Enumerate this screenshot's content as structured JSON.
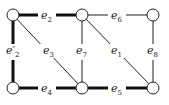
{
  "diagram": {
    "type": "graph",
    "nodes": [
      {
        "id": "tl",
        "x": 13,
        "y": 15
      },
      {
        "id": "tm",
        "x": 82,
        "y": 15
      },
      {
        "id": "tr",
        "x": 153,
        "y": 15
      },
      {
        "id": "bl",
        "x": 13,
        "y": 88
      },
      {
        "id": "bm",
        "x": 82,
        "y": 88
      },
      {
        "id": "br",
        "x": 153,
        "y": 88
      }
    ],
    "edges": [
      {
        "label": "e",
        "sub": "2",
        "prime": false,
        "from": "tl",
        "to": "tm",
        "thick": true
      },
      {
        "label": "e",
        "sub": "6",
        "prime": false,
        "from": "tm",
        "to": "tr",
        "thick": false
      },
      {
        "label": "e",
        "sub": "2",
        "prime": true,
        "from": "tl",
        "to": "bl",
        "thick": true
      },
      {
        "label": "e",
        "sub": "3",
        "prime": false,
        "from": "tl",
        "to": "bm",
        "thick": false
      },
      {
        "label": "e",
        "sub": "7",
        "prime": false,
        "from": "tm",
        "to": "bm",
        "thick": false
      },
      {
        "label": "e",
        "sub": "1",
        "prime": false,
        "from": "tm",
        "to": "br",
        "thick": false
      },
      {
        "label": "e",
        "sub": "8",
        "prime": false,
        "from": "tr",
        "to": "br",
        "thick": false
      },
      {
        "label": "e",
        "sub": "4",
        "prime": false,
        "from": "bl",
        "to": "bm",
        "thick": true
      },
      {
        "label": "e",
        "sub": "5",
        "prime": false,
        "from": "bm",
        "to": "br",
        "thick": true
      }
    ],
    "labels": {
      "e2": "e",
      "e2_sub": "2",
      "e2p": "e′",
      "e2p_sub": "2",
      "e3": "e",
      "e3_sub": "3",
      "e7": "e",
      "e7_sub": "7",
      "e1": "e",
      "e1_sub": "1",
      "e6": "e",
      "e6_sub": "6",
      "e8": "e",
      "e8_sub": "8",
      "e4": "e",
      "e4_sub": "4",
      "e5": "e",
      "e5_sub": "5"
    },
    "colors": {
      "line": "#222222",
      "node_fill": "#ffffff"
    }
  }
}
